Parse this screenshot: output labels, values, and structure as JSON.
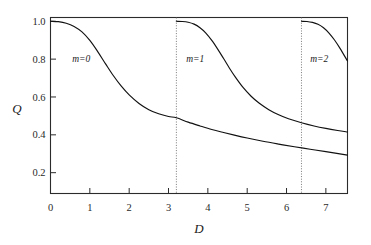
{
  "chart_data": {
    "type": "line",
    "title": "",
    "xlabel": "D",
    "ylabel": "Q",
    "xlim": [
      0,
      7.55
    ],
    "ylim": [
      0.09,
      1.02
    ],
    "grid": false,
    "legend": "none",
    "xticks": [
      0,
      1,
      2,
      3,
      4,
      5,
      6,
      7
    ],
    "xticklabels": [
      "0",
      "1",
      "2",
      "3",
      "4",
      "5",
      "6",
      "7"
    ],
    "yticks": [
      0.2,
      0.4,
      0.6,
      0.8,
      1.0
    ],
    "yticklabels": [
      "0.2",
      "0.4",
      "0.6",
      "0.8",
      "1.0"
    ],
    "annotations": [
      {
        "text": "m=0",
        "x": 0.55,
        "y": 0.8
      },
      {
        "text": "m=1",
        "x": 3.45,
        "y": 0.8
      },
      {
        "text": "m=2",
        "x": 6.6,
        "y": 0.8
      }
    ],
    "vertical_markers": [
      {
        "x": 3.2,
        "style": "dotted"
      },
      {
        "x": 6.38,
        "style": "dotted"
      }
    ],
    "series": [
      {
        "name": "m=0",
        "branch_start": 0.0,
        "x": [
          0.0,
          0.2,
          0.4,
          0.6,
          0.8,
          1.0,
          1.2,
          1.4,
          1.6,
          1.8,
          2.0,
          2.25,
          2.5,
          2.75,
          3.0,
          3.2,
          3.5,
          3.8,
          4.1,
          4.4,
          4.7,
          5.0,
          5.4,
          5.8,
          6.2,
          6.6,
          7.0,
          7.55
        ],
        "y": [
          1.0,
          0.998,
          0.99,
          0.973,
          0.944,
          0.899,
          0.84,
          0.775,
          0.712,
          0.657,
          0.611,
          0.566,
          0.533,
          0.511,
          0.497,
          0.49,
          0.467,
          0.447,
          0.428,
          0.412,
          0.397,
          0.383,
          0.366,
          0.351,
          0.337,
          0.324,
          0.311,
          0.293
        ]
      },
      {
        "name": "m=1",
        "branch_start": 3.2,
        "x": [
          3.2,
          3.35,
          3.5,
          3.65,
          3.8,
          3.95,
          4.1,
          4.25,
          4.4,
          4.55,
          4.7,
          4.9,
          5.1,
          5.3,
          5.55,
          5.8,
          6.05,
          6.38,
          6.7,
          7.0,
          7.3,
          7.55
        ],
        "y": [
          1.0,
          0.999,
          0.995,
          0.985,
          0.966,
          0.938,
          0.899,
          0.853,
          0.803,
          0.752,
          0.705,
          0.649,
          0.604,
          0.568,
          0.533,
          0.506,
          0.485,
          0.464,
          0.447,
          0.434,
          0.423,
          0.415
        ]
      },
      {
        "name": "m=2",
        "branch_start": 6.38,
        "x": [
          6.38,
          6.52,
          6.66,
          6.8,
          6.94,
          7.08,
          7.22,
          7.36,
          7.55
        ],
        "y": [
          1.0,
          0.999,
          0.994,
          0.984,
          0.966,
          0.938,
          0.901,
          0.857,
          0.79
        ]
      }
    ]
  },
  "axes": {
    "y_label": "Q",
    "x_label": "D"
  }
}
